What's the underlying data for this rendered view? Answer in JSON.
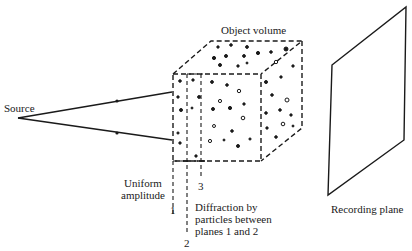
{
  "diagram": {
    "labels": {
      "source": "Source",
      "object_volume": "Object volume",
      "uniform_amplitude_line1": "Uniform",
      "uniform_amplitude_line2": "amplitude",
      "diffraction_line1": "Diffraction by",
      "diffraction_line2": "particles between",
      "diffraction_line3": "planes 1 and 2",
      "recording_plane": "Recording plane",
      "plane_1": "1",
      "plane_2": "2",
      "plane_3": "3"
    },
    "colors": {
      "ink": "#1a1a1a",
      "background": "#ffffff"
    },
    "nodes": [
      {
        "id": "source",
        "type": "point-source"
      },
      {
        "id": "object-volume",
        "type": "dashed-cube-with-particles"
      },
      {
        "id": "plane-1",
        "type": "dashed-plane"
      },
      {
        "id": "plane-2",
        "type": "dashed-plane"
      },
      {
        "id": "plane-3",
        "type": "dashed-plane"
      },
      {
        "id": "recording-plane",
        "type": "parallelogram"
      }
    ],
    "edges": [
      {
        "from": "source",
        "to": "object-volume",
        "label": "ray upper"
      },
      {
        "from": "source",
        "to": "object-volume",
        "label": "ray lower"
      }
    ]
  }
}
